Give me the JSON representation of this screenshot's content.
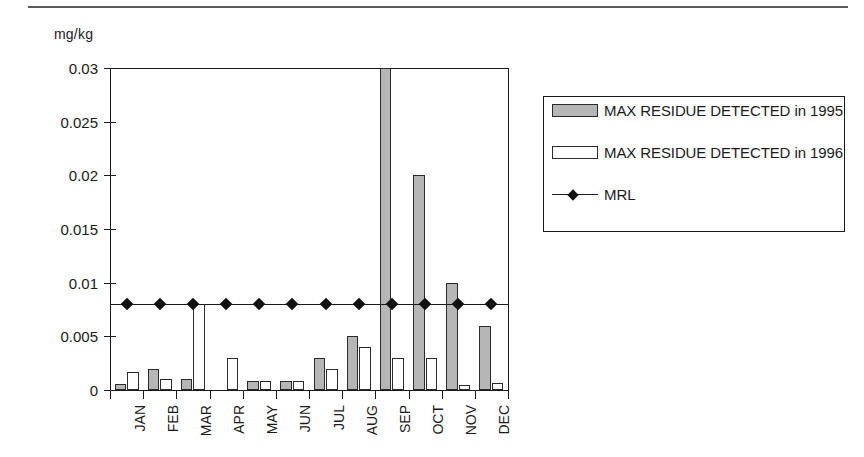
{
  "chart_data": {
    "type": "bar",
    "title": "",
    "subtitle": "",
    "xlabel": "",
    "ylabel": "mg/kg",
    "ylim": [
      0,
      0.03
    ],
    "ytick_labels": [
      "0",
      "0.005",
      "0.01",
      "0.015",
      "0.02",
      "0.025",
      "0.03"
    ],
    "ytick_values": [
      0,
      0.005,
      0.01,
      0.015,
      0.02,
      0.025,
      0.03
    ],
    "grid": false,
    "legend_position": "right",
    "categories": [
      "JAN",
      "FEB",
      "MAR",
      "APR",
      "MAY",
      "JUN",
      "JUL",
      "AUG",
      "SEP",
      "OCT",
      "NOV",
      "DEC"
    ],
    "series": [
      {
        "name": "MAX RESIDUE DETECTED in 1995",
        "type": "bar",
        "color": "#b6b6b6",
        "values": [
          0.0006,
          0.002,
          0.001,
          0,
          0.0008,
          0.0008,
          0.003,
          0.005,
          0.03,
          0.02,
          0.01,
          0.006
        ]
      },
      {
        "name": "MAX RESIDUE DETECTED in 1996",
        "type": "bar",
        "color": "#ffffff",
        "values": [
          0.0017,
          0.001,
          0.008,
          0.003,
          0.0008,
          0.0008,
          0.002,
          0.004,
          0.003,
          0.003,
          0.0005,
          0.0007
        ]
      },
      {
        "name": "MRL",
        "type": "line",
        "color": "#1a1a1a",
        "marker": "diamond",
        "values": [
          0.008,
          0.008,
          0.008,
          0.008,
          0.008,
          0.008,
          0.008,
          0.008,
          0.008,
          0.008,
          0.008,
          0.008
        ]
      }
    ]
  },
  "axis": {
    "unit_label": "mg/kg"
  },
  "legend": {
    "entries": [
      {
        "label": "MAX RESIDUE DETECTED in 1995",
        "swatch": "filled-gray"
      },
      {
        "label": "MAX RESIDUE DETECTED in 1996",
        "swatch": "filled-white"
      },
      {
        "label": "MRL",
        "swatch": "line-diamond"
      }
    ]
  }
}
